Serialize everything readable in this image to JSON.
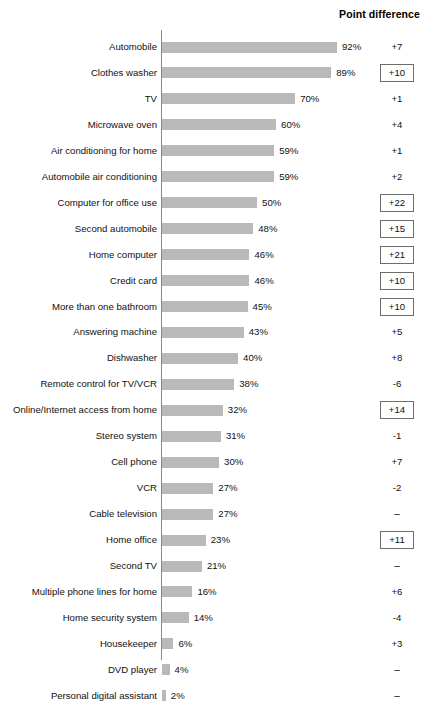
{
  "header": {
    "point_difference_label": "Point difference"
  },
  "chart_data": {
    "type": "bar",
    "orientation": "horizontal",
    "title": "",
    "subtitle": "",
    "xlabel": "",
    "ylabel": "",
    "xlim": [
      0,
      100
    ],
    "grid": false,
    "legend": null,
    "value_suffix": "%",
    "columns": [
      "Item",
      "Percent",
      "Point difference"
    ],
    "categories": [
      "Automobile",
      "Clothes washer",
      "TV",
      "Microwave oven",
      "Air conditioning for home",
      "Automobile air conditioning",
      "Computer for office use",
      "Second automobile",
      "Home computer",
      "Credit card",
      "More than one bathroom",
      "Answering machine",
      "Dishwasher",
      "Remote control for TV/VCR",
      "Online/Internet access from home",
      "Stereo system",
      "Cell phone",
      "VCR",
      "Cable television",
      "Home office",
      "Second TV",
      "Multiple phone lines for home",
      "Home security system",
      "Housekeeper",
      "DVD player",
      "Personal digital assistant"
    ],
    "values": [
      92,
      89,
      70,
      60,
      59,
      59,
      50,
      48,
      46,
      46,
      45,
      43,
      40,
      38,
      32,
      31,
      30,
      27,
      27,
      23,
      21,
      16,
      14,
      6,
      4,
      2
    ],
    "value_labels": [
      "92%",
      "89%",
      "70%",
      "60%",
      "59%",
      "59%",
      "50%",
      "48%",
      "46%",
      "46%",
      "45%",
      "43%",
      "40%",
      "38%",
      "32%",
      "31%",
      "30%",
      "27%",
      "27%",
      "23%",
      "21%",
      "16%",
      "14%",
      "6%",
      "4%",
      "2%"
    ],
    "point_difference": [
      "+7",
      "+10",
      "+1",
      "+4",
      "+1",
      "+2",
      "+22",
      "+15",
      "+21",
      "+10",
      "+10",
      "+5",
      "+8",
      "-6",
      "+14",
      "-1",
      "+7",
      "-2",
      "–",
      "+11",
      "–",
      "+6",
      "-4",
      "+3",
      "–",
      "–"
    ],
    "point_difference_boxed": [
      false,
      true,
      false,
      false,
      false,
      false,
      true,
      true,
      true,
      true,
      true,
      false,
      false,
      false,
      true,
      false,
      false,
      false,
      false,
      true,
      false,
      false,
      false,
      false,
      false,
      false
    ],
    "colors": {
      "bar": "#b9b9b9",
      "axis": "#8a8a8a",
      "text": "#111111",
      "box_border": "#6d6d6d",
      "background": "#ffffff"
    }
  }
}
